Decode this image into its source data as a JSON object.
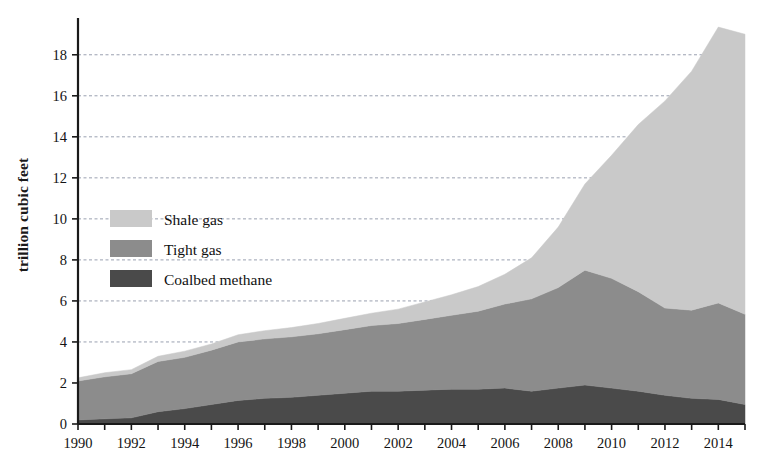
{
  "chart_data": {
    "type": "area",
    "stacked": true,
    "title": "",
    "xlabel": "",
    "ylabel": "trillion cubic feet",
    "xlim": [
      1990,
      2015
    ],
    "ylim": [
      0,
      19.5
    ],
    "yticks": [
      0,
      2,
      4,
      6,
      8,
      10,
      12,
      14,
      16,
      18
    ],
    "ytick_labels": [
      "0",
      "2",
      "4",
      "6",
      "8",
      "10",
      "12",
      "14",
      "16",
      "18"
    ],
    "xticks": [
      1990,
      1991,
      1992,
      1993,
      1994,
      1995,
      1996,
      1997,
      1998,
      1999,
      2000,
      2001,
      2002,
      2003,
      2004,
      2005,
      2006,
      2007,
      2008,
      2009,
      2010,
      2011,
      2012,
      2013,
      2014,
      2015
    ],
    "xtick_labels_shown": [
      "1990",
      "1992",
      "1994",
      "1996",
      "1998",
      "2000",
      "2002",
      "2004",
      "2006",
      "2008",
      "2010",
      "2012",
      "2014"
    ],
    "grid": true,
    "grid_style": "dashed",
    "grid_axis": "y",
    "legend_position": "left-middle",
    "x": [
      1990,
      1991,
      1992,
      1993,
      1994,
      1995,
      1996,
      1997,
      1998,
      1999,
      2000,
      2001,
      2002,
      2003,
      2004,
      2005,
      2006,
      2007,
      2008,
      2009,
      2010,
      2011,
      2012,
      2013,
      2014,
      2015
    ],
    "series": [
      {
        "name": "Coalbed methane",
        "color": "#4a4a4a",
        "values": [
          0.2,
          0.25,
          0.3,
          0.6,
          0.75,
          0.95,
          1.15,
          1.25,
          1.3,
          1.4,
          1.5,
          1.6,
          1.6,
          1.65,
          1.7,
          1.7,
          1.75,
          1.6,
          1.75,
          1.9,
          1.75,
          1.6,
          1.4,
          1.25,
          1.2,
          0.95
        ]
      },
      {
        "name": "Tight gas",
        "color": "#8c8c8c",
        "values": [
          1.9,
          2.05,
          2.15,
          2.45,
          2.5,
          2.65,
          2.85,
          2.9,
          2.95,
          3.0,
          3.1,
          3.2,
          3.3,
          3.45,
          3.6,
          3.8,
          4.1,
          4.5,
          4.9,
          5.6,
          5.35,
          4.85,
          4.25,
          4.3,
          4.7,
          4.4
        ]
      },
      {
        "name": "Shale gas",
        "color": "#c9c9c9",
        "values": [
          0.15,
          0.2,
          0.2,
          0.25,
          0.3,
          0.3,
          0.35,
          0.4,
          0.45,
          0.5,
          0.55,
          0.6,
          0.7,
          0.85,
          1.0,
          1.2,
          1.45,
          2.0,
          2.95,
          4.2,
          6.0,
          8.15,
          10.1,
          11.65,
          13.45,
          13.65
        ]
      }
    ],
    "totals": [
      2.25,
      2.5,
      2.65,
      3.3,
      3.55,
      3.9,
      4.35,
      4.55,
      4.7,
      4.9,
      5.15,
      5.4,
      5.6,
      5.95,
      6.3,
      6.7,
      7.3,
      8.1,
      9.6,
      11.7,
      13.1,
      14.6,
      15.75,
      17.2,
      19.35,
      19.0
    ]
  },
  "legend": {
    "items": [
      {
        "label": "Shale gas",
        "color": "#c9c9c9"
      },
      {
        "label": "Tight gas",
        "color": "#8c8c8c"
      },
      {
        "label": "Coalbed methane",
        "color": "#4a4a4a"
      }
    ]
  },
  "axes": {
    "y_title": "trillion cubic feet"
  }
}
